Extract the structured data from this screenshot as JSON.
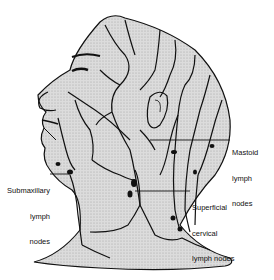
{
  "figure": {
    "style": "black-and-white stippled anatomical illustration",
    "colors": {
      "background": "#ffffff",
      "skin": "#d9d9d9",
      "lines": "#111111"
    }
  },
  "labels": {
    "mastoid": {
      "line1": "Mastoid",
      "line2": "lymph",
      "line3": "nodes"
    },
    "submaxillary": {
      "line1": "Submaxillary",
      "line2": "lymph",
      "line3": "nodes"
    },
    "superficial_cervical": {
      "line1": "Superficial",
      "line2": "cervical",
      "line3": "lymph nodes"
    }
  }
}
